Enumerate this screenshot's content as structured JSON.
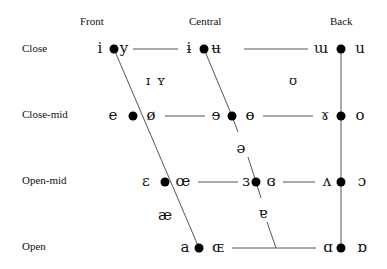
{
  "diagram": {
    "columns": {
      "front": "Front",
      "central": "Central",
      "back": "Back"
    },
    "rows": {
      "close": "Close",
      "close_mid": "Close-mid",
      "open_mid": "Open-mid",
      "open": "Open"
    },
    "vowels": {
      "close_front_unrounded": "i",
      "close_front_rounded": "y",
      "close_central_unrounded": "ɨ",
      "close_central_rounded": "ʉ",
      "close_back_unrounded": "ɯ",
      "close_back_rounded": "u",
      "near_close_front_unrounded": "ɪ",
      "near_close_front_rounded": "ʏ",
      "near_close_back_rounded": "ʊ",
      "close_mid_front_unrounded": "e",
      "close_mid_front_rounded": "ø",
      "close_mid_central_unrounded": "ɘ",
      "close_mid_central_rounded": "ɵ",
      "close_mid_back_unrounded": "ɤ",
      "close_mid_back_rounded": "o",
      "mid_central": "ə",
      "open_mid_front_unrounded": "ɛ",
      "open_mid_front_rounded": "œ",
      "open_mid_central_unrounded": "ɜ",
      "open_mid_central_rounded": "ɞ",
      "open_mid_back_unrounded": "ʌ",
      "open_mid_back_rounded": "ɔ",
      "near_open_front_unrounded": "æ",
      "near_open_central": "ɐ",
      "open_front_unrounded": "a",
      "open_front_rounded": "ɶ",
      "open_back_unrounded": "ɑ",
      "open_back_rounded": "ɒ"
    },
    "colors": {
      "line": "#555555",
      "dot": "#000000",
      "text": "#111111"
    }
  }
}
